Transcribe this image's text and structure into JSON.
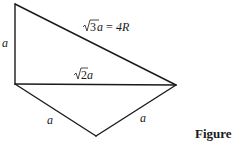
{
  "diagram": {
    "edges": {
      "left_vertical": "a",
      "hypotenuse": {
        "root": "3",
        "var": "a",
        "equals": "=",
        "rhs": "4R"
      },
      "middle_horizontal": {
        "root": "2",
        "var": "a"
      },
      "bottom_left": "a",
      "bottom_right": "a"
    },
    "caption": "Figure",
    "colors": {
      "line": "#1a1a1a",
      "background": "#ffffff"
    }
  }
}
